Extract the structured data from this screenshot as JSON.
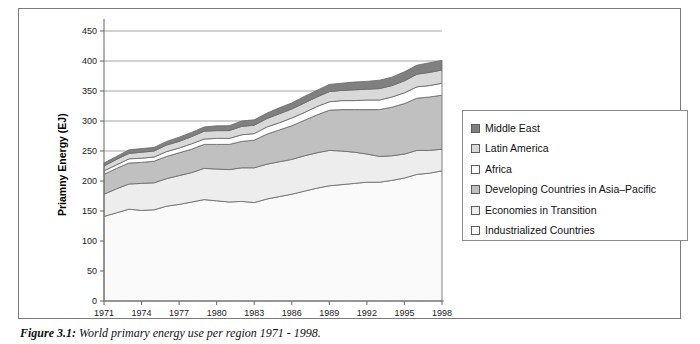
{
  "figure": {
    "caption_label": "Figure 3.1:",
    "caption_text": "World primary energy use per region 1971 - 1998."
  },
  "legend": {
    "position": "right-inside",
    "items": [
      {
        "label": "Middle East",
        "color": "#808080",
        "swatch_name": "legend-swatch-middle-east"
      },
      {
        "label": "Latin America",
        "color": "#d9d9d9",
        "swatch_name": "legend-swatch-latin-america"
      },
      {
        "label": "Africa",
        "color": "#ffffff",
        "swatch_name": "legend-swatch-africa"
      },
      {
        "label": "Developing Countries in Asia–Pacific",
        "color": "#c0c0c0",
        "swatch_name": "legend-swatch-developing-asia-pacific"
      },
      {
        "label": "Economies in Transition",
        "color": "#ededed",
        "swatch_name": "legend-swatch-economies-in-transition"
      },
      {
        "label": "Industrialized Countries",
        "color": "#fafafa",
        "swatch_name": "legend-swatch-industrialized-countries"
      }
    ]
  },
  "chart_data": {
    "type": "area",
    "stacked": true,
    "title": "",
    "xlabel": "",
    "ylabel": "Priamny Energy (EJ)",
    "xlim": [
      1971,
      1998
    ],
    "ylim": [
      0,
      450
    ],
    "ytick_values": [
      0,
      50,
      100,
      150,
      200,
      250,
      300,
      350,
      400,
      450
    ],
    "ytick_labels": [
      "0",
      "50",
      "100",
      "150",
      "200",
      "250",
      "300",
      "350",
      "400",
      "450"
    ],
    "xtick_values": [
      1971,
      1974,
      1977,
      1980,
      1983,
      1986,
      1989,
      1992,
      1995,
      1998
    ],
    "xtick_labels": [
      "1971",
      "1974",
      "1977",
      "1980",
      "1983",
      "1986",
      "1989",
      "1992",
      "1995",
      "1998"
    ],
    "grid": "horizontal",
    "x": [
      1971,
      1972,
      1973,
      1974,
      1975,
      1976,
      1977,
      1978,
      1979,
      1980,
      1981,
      1982,
      1983,
      1984,
      1985,
      1986,
      1987,
      1988,
      1989,
      1990,
      1991,
      1992,
      1993,
      1994,
      1995,
      1996,
      1997,
      1998
    ],
    "stack_order_bottom_to_top": [
      "Industrialized Countries",
      "Economies in Transition",
      "Developing Countries in Asia–Pacific",
      "Africa",
      "Latin America",
      "Middle East"
    ],
    "series": [
      {
        "name": "Industrialized Countries",
        "color": "#fafafa",
        "values": [
          141,
          147,
          153,
          151,
          152,
          158,
          161,
          165,
          169,
          167,
          165,
          166,
          164,
          170,
          174,
          178,
          183,
          188,
          192,
          194,
          196,
          198,
          198,
          201,
          205,
          211,
          213,
          217
        ]
      },
      {
        "name": "Economies in Transition",
        "color": "#ededed",
        "values": [
          37,
          40,
          42,
          45,
          45,
          46,
          48,
          49,
          52,
          53,
          54,
          56,
          58,
          58,
          58,
          58,
          59,
          59,
          59,
          56,
          52,
          47,
          43,
          41,
          40,
          40,
          38,
          36
        ]
      },
      {
        "name": "Developing Countries in Asia–Pacific",
        "color": "#c0c0c0",
        "values": [
          33,
          34,
          35,
          35,
          36,
          37,
          38,
          39,
          40,
          41,
          42,
          44,
          46,
          50,
          53,
          56,
          59,
          63,
          67,
          69,
          71,
          74,
          78,
          81,
          84,
          87,
          89,
          90
        ]
      },
      {
        "name": "Africa",
        "color": "#ffffff",
        "values": [
          6,
          6,
          7,
          7,
          7,
          8,
          8,
          9,
          9,
          10,
          10,
          11,
          11,
          12,
          12,
          13,
          13,
          14,
          14,
          15,
          15,
          16,
          16,
          17,
          18,
          19,
          19,
          20
        ]
      },
      {
        "name": "Latin America",
        "color": "#d9d9d9",
        "values": [
          8,
          9,
          9,
          10,
          10,
          11,
          11,
          12,
          13,
          13,
          13,
          14,
          14,
          14,
          15,
          15,
          16,
          16,
          17,
          17,
          18,
          18,
          19,
          19,
          20,
          21,
          22,
          22
        ]
      },
      {
        "name": "Middle East",
        "color": "#808080",
        "values": [
          5,
          5,
          6,
          6,
          6,
          6,
          7,
          7,
          7,
          8,
          8,
          9,
          9,
          9,
          10,
          10,
          11,
          11,
          12,
          12,
          13,
          13,
          14,
          14,
          15,
          15,
          16,
          16
        ]
      }
    ],
    "totals": [
      230,
      241,
      252,
      254,
      256,
      266,
      273,
      281,
      290,
      292,
      292,
      300,
      302,
      313,
      322,
      330,
      341,
      351,
      361,
      363,
      365,
      366,
      368,
      373,
      382,
      393,
      397,
      401
    ]
  }
}
